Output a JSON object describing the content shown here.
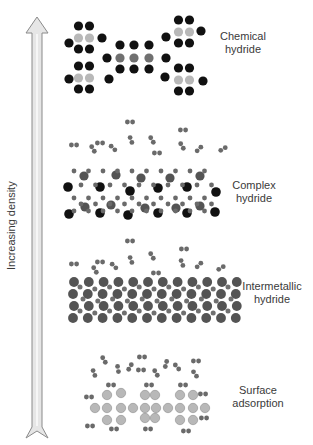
{
  "figure": {
    "axis_label": "Increasing density",
    "axis_direction": "up",
    "colors": {
      "arrow_fill": "#e6e6e6",
      "arrow_stroke": "#8a8a8a",
      "black_atom": "#111111",
      "light_gray_atom": "#b8b8b8",
      "mid_gray_atom": "#707070",
      "dark_gray_atom": "#545454",
      "h2_molecule": "#6a6a6a",
      "text": "#3a3a3a"
    },
    "categories": [
      {
        "id": "chemical-hydride",
        "line1": "Chemical",
        "line2": "hydride",
        "label_x": 243,
        "label_y": 37
      },
      {
        "id": "complex-hydride",
        "line1": "Complex",
        "line2": "hydride",
        "label_x": 254,
        "label_y": 179
      },
      {
        "id": "intermetallic-hydride",
        "line1": "Intermetallic",
        "line2": "hydride",
        "label_x": 271,
        "label_y": 279
      },
      {
        "id": "surface-adsorption",
        "line1": "Surface",
        "line2": "adsorption",
        "label_x": 257,
        "label_y": 383
      }
    ]
  }
}
